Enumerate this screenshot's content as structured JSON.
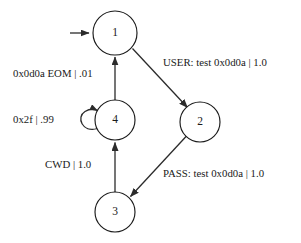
{
  "diagram": {
    "background_color": "#ffffff",
    "stroke_color": "#1a1a1a",
    "nodes": [
      {
        "id": "1",
        "label": "1",
        "cx": 115,
        "cy": 33,
        "r": 22
      },
      {
        "id": "2",
        "label": "2",
        "cx": 200,
        "cy": 122,
        "r": 20
      },
      {
        "id": "3",
        "label": "3",
        "cx": 115,
        "cy": 212,
        "r": 20
      },
      {
        "id": "4",
        "label": "4",
        "cx": 115,
        "cy": 120,
        "r": 20
      }
    ],
    "start_marker": {
      "target": "1",
      "from_x": 70,
      "to_x": 91,
      "y": 33
    },
    "edges": [
      {
        "from": "1",
        "to": "2",
        "label": "USER: test 0x0d0a | 1.0",
        "kind": "diagonal"
      },
      {
        "from": "2",
        "to": "3",
        "label": "PASS: test 0x0d0a | 1.0",
        "kind": "diagonal"
      },
      {
        "from": "3",
        "to": "4",
        "label": "CWD | 1.0",
        "kind": "vertical"
      },
      {
        "from": "4",
        "to": "1",
        "label": "0x0d0a EOM | .01",
        "kind": "vertical"
      },
      {
        "from": "4",
        "to": "4",
        "label": "0x2f | .99",
        "kind": "self-loop"
      }
    ]
  }
}
